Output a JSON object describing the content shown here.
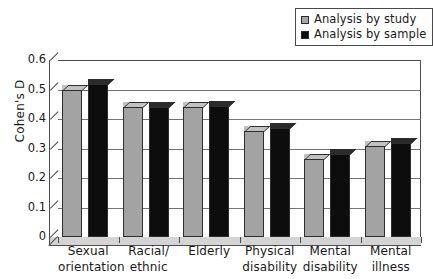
{
  "chart_data": {
    "type": "bar",
    "title": "",
    "xlabel": "",
    "ylabel": "Cohen's D",
    "ylim": [
      0,
      0.6
    ],
    "ytick_labels": [
      "0.6",
      "0.5",
      "0.4",
      "0.3",
      "0.2",
      "0.1",
      "0"
    ],
    "ytick_values": [
      0.6,
      0.5,
      0.4,
      0.3,
      0.2,
      0.1,
      0
    ],
    "grid": "horizontal",
    "legend_position": "top-right",
    "style": "3d-column",
    "categories": [
      "Sexual orientation",
      "Racial/ethnic",
      "Elderly",
      "Physical disability",
      "Mental disability",
      "Mental illness"
    ],
    "category_lines": [
      [
        "Sexual",
        "orientation"
      ],
      [
        "Racial/",
        "ethnic"
      ],
      [
        "Elderly",
        ""
      ],
      [
        "Physical",
        "disability"
      ],
      [
        "Mental",
        "disability"
      ],
      [
        "Mental",
        "illness"
      ]
    ],
    "series": [
      {
        "name": "Analysis by study",
        "color": "#a3a3a3",
        "values": [
          0.5,
          0.44,
          0.44,
          0.36,
          0.265,
          0.31
        ]
      },
      {
        "name": "Analysis by sample",
        "color": "#0d0d0d",
        "values": [
          0.52,
          0.44,
          0.445,
          0.37,
          0.28,
          0.32
        ]
      }
    ]
  },
  "legend": {
    "entries": [
      {
        "label": "Analysis by study",
        "swatch": "#a3a3a3"
      },
      {
        "label": "Analysis by sample",
        "swatch": "#0d0d0d"
      }
    ]
  },
  "axes": {
    "y_title": "Cohen's D"
  }
}
